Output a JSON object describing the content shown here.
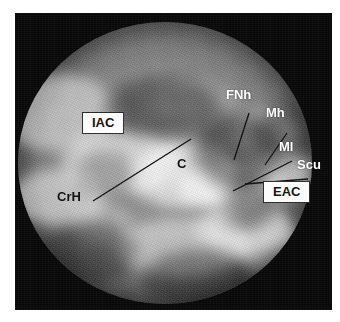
{
  "figure": {
    "kind": "tomogram",
    "frame_color": "#080808",
    "page_background": "#ffffff"
  },
  "annotations": {
    "boxed": [
      {
        "id": "iac",
        "text": "IAC",
        "style": "boxed-black-on-white",
        "x": 82,
        "y": 112
      },
      {
        "id": "eac",
        "text": "EAC",
        "style": "boxed-black-on-white",
        "x": 263,
        "y": 181
      }
    ],
    "plain": [
      {
        "id": "fnh",
        "text": "FNh",
        "color": "#ffffff",
        "x": 226,
        "y": 88
      },
      {
        "id": "mh",
        "text": "Mh",
        "color": "#ffffff",
        "x": 266,
        "y": 106
      },
      {
        "id": "ml",
        "text": "Ml",
        "color": "#ffffff",
        "x": 279,
        "y": 140
      },
      {
        "id": "scu",
        "text": "Scu",
        "color": "#ffffff",
        "x": 297,
        "y": 158
      },
      {
        "id": "crh",
        "text": "CrH",
        "color": "#101010",
        "x": 57,
        "y": 190
      },
      {
        "id": "c",
        "text": "C",
        "color": "#101010",
        "x": 177,
        "y": 157
      }
    ],
    "leader_lines": [
      {
        "id": "crh-leader",
        "x1": 78,
        "y1": 188,
        "x2": 176,
        "y2": 126
      },
      {
        "id": "fnh-leader",
        "x1": 234,
        "y1": 100,
        "x2": 219,
        "y2": 147
      },
      {
        "id": "mh-leader",
        "x1": 272,
        "y1": 120,
        "x2": 250,
        "y2": 152
      },
      {
        "id": "ml-leader",
        "x1": 277,
        "y1": 148,
        "x2": 218,
        "y2": 178
      },
      {
        "id": "scu-leader",
        "x1": 293,
        "y1": 166,
        "x2": 230,
        "y2": 171
      }
    ]
  }
}
